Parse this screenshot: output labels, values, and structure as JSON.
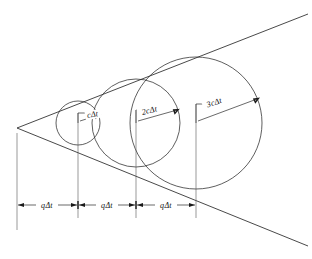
{
  "figure": {
    "type": "geometric-diagram",
    "background_color": "#ffffff",
    "line_color": "#1a1a1a",
    "width": 312,
    "height": 259
  },
  "labels": {
    "radius": [
      {
        "text": "cΔt",
        "x": 95,
        "y": 118,
        "rotation": -10
      },
      {
        "text": "2cΔt",
        "x": 150,
        "y": 114,
        "rotation": -14
      },
      {
        "text": "3cΔt",
        "x": 215,
        "y": 106,
        "rotation": -18
      }
    ],
    "dimension": [
      {
        "text": "qΔt",
        "x": 47,
        "y": 207
      },
      {
        "text": "qΔt",
        "x": 107,
        "y": 207
      },
      {
        "text": "qΔt",
        "x": 166,
        "y": 207
      }
    ]
  },
  "geometry": {
    "apex": {
      "x": 17,
      "y": 128
    },
    "axis_y": 123,
    "circles": [
      {
        "name": "wavefront-1",
        "cx": 78,
        "cy": 123,
        "r": 22
      },
      {
        "name": "wavefront-2",
        "cx": 136,
        "cy": 123,
        "r": 44
      },
      {
        "name": "wavefront-3",
        "cx": 196,
        "cy": 123,
        "r": 66
      }
    ],
    "mach_lines": {
      "upper_end": {
        "x": 308,
        "y": 14
      },
      "lower_end": {
        "x": 308,
        "y": 246
      }
    },
    "dimension_line_y": 205,
    "tick_positions": [
      17,
      78,
      136,
      196
    ]
  },
  "legend": {
    "description": "Three expanding spherical wavefronts emitted at equal time intervals by a source moving to the right; the common tangent lines form the Mach cone."
  }
}
